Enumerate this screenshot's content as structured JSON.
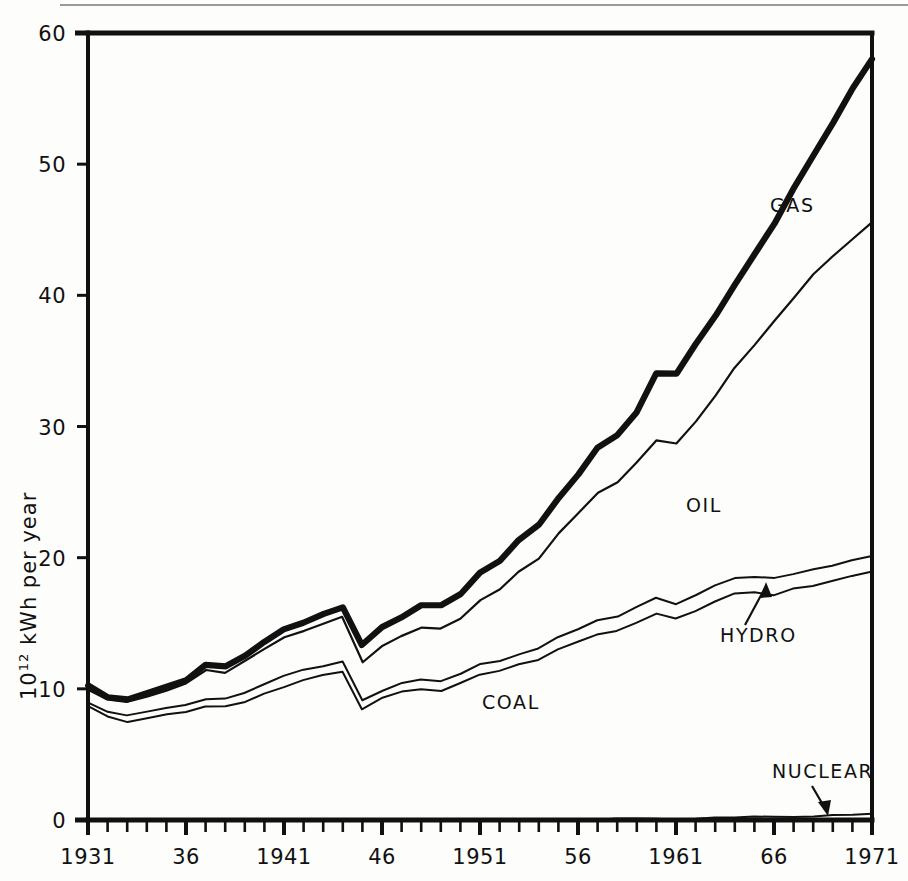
{
  "figure": {
    "title": "",
    "y_axis_label_prefix": "10",
    "y_axis_label_exponent": "12",
    "y_axis_label_suffix": " kWh per year"
  },
  "axes": {
    "y_ticks": [
      "0",
      "10",
      "20",
      "30",
      "40",
      "50",
      "60"
    ],
    "x_ticks": [
      "1931",
      "36",
      "1941",
      "46",
      "1951",
      "56",
      "1961",
      "66",
      "1971"
    ]
  },
  "labels": {
    "gas": "GAS",
    "oil": "OIL",
    "hydro": "HYDRO",
    "coal": "COAL",
    "nuclear": "NUCLEAR"
  },
  "colors": {
    "ink": "#111111",
    "paper": "#fdfdfb",
    "page_rule": "#9a9a9a"
  },
  "chart_data": {
    "type": "area",
    "title": "",
    "xlabel": "",
    "ylabel": "10^12 kWh per year",
    "xlim": [
      1931,
      1971
    ],
    "ylim": [
      0,
      60
    ],
    "grid": false,
    "legend": "inline-annotations",
    "stacking": "cumulative (bottom to top: NUCLEAR, COAL, HYDRO, OIL, GAS)",
    "x": [
      1931,
      1932,
      1933,
      1934,
      1935,
      1936,
      1937,
      1938,
      1939,
      1940,
      1941,
      1942,
      1943,
      1944,
      1945,
      1946,
      1947,
      1948,
      1949,
      1950,
      1951,
      1952,
      1953,
      1954,
      1955,
      1956,
      1957,
      1958,
      1959,
      1960,
      1961,
      1962,
      1963,
      1964,
      1965,
      1966,
      1967,
      1968,
      1969,
      1970,
      1971
    ],
    "series": [
      {
        "name": "NUCLEAR",
        "cumulative": [
          0,
          0,
          0,
          0,
          0,
          0,
          0,
          0,
          0,
          0,
          0,
          0,
          0,
          0,
          0,
          0,
          0,
          0,
          0,
          0,
          0,
          0,
          0,
          0,
          0,
          0,
          0.02,
          0.04,
          0.06,
          0.08,
          0.1,
          0.12,
          0.15,
          0.18,
          0.22,
          0.26,
          0.3,
          0.34,
          0.38,
          0.44,
          0.5
        ],
        "values": [
          0,
          0,
          0,
          0,
          0,
          0,
          0,
          0,
          0,
          0,
          0,
          0,
          0,
          0,
          0,
          0,
          0,
          0,
          0,
          0,
          0,
          0,
          0,
          0,
          0,
          0,
          0.02,
          0.04,
          0.06,
          0.08,
          0.1,
          0.12,
          0.15,
          0.18,
          0.22,
          0.26,
          0.3,
          0.34,
          0.38,
          0.44,
          0.5
        ]
      },
      {
        "name": "COAL",
        "cumulative": [
          8.6,
          7.9,
          7.5,
          7.8,
          8.1,
          8.3,
          8.6,
          8.6,
          9.0,
          9.6,
          10.2,
          10.6,
          11.0,
          11.3,
          8.5,
          9.3,
          9.8,
          10.0,
          9.9,
          10.4,
          11.1,
          11.3,
          11.8,
          12.2,
          13.0,
          13.6,
          14.2,
          14.4,
          15.1,
          15.7,
          15.4,
          16.0,
          16.6,
          17.2,
          17.4,
          17.1,
          17.6,
          17.9,
          18.2,
          18.6,
          19.0
        ],
        "values": [
          8.6,
          7.9,
          7.5,
          7.8,
          8.1,
          8.3,
          8.6,
          8.6,
          9.0,
          9.6,
          10.2,
          10.6,
          11.0,
          11.3,
          8.5,
          9.3,
          9.8,
          10.0,
          9.9,
          10.4,
          11.1,
          11.3,
          11.8,
          12.2,
          13.0,
          13.6,
          14.2,
          14.4,
          15.1,
          15.6,
          15.3,
          15.9,
          16.5,
          17.0,
          17.2,
          16.8,
          17.3,
          17.6,
          17.8,
          18.2,
          18.5
        ]
      },
      {
        "name": "HYDRO",
        "cumulative": [
          9.0,
          8.3,
          7.9,
          8.2,
          8.6,
          8.8,
          9.2,
          9.2,
          9.7,
          10.3,
          11.0,
          11.4,
          11.8,
          12.1,
          9.1,
          9.9,
          10.4,
          10.7,
          10.6,
          11.1,
          11.9,
          12.1,
          12.7,
          13.1,
          13.9,
          14.6,
          15.3,
          15.5,
          16.2,
          16.9,
          16.5,
          17.2,
          17.9,
          18.4,
          18.6,
          18.4,
          18.8,
          19.1,
          19.4,
          19.8,
          20.1
        ],
        "values": [
          0.4,
          0.4,
          0.4,
          0.4,
          0.5,
          0.5,
          0.6,
          0.6,
          0.7,
          0.7,
          0.8,
          0.8,
          0.8,
          0.8,
          0.6,
          0.6,
          0.6,
          0.7,
          0.7,
          0.7,
          0.8,
          0.8,
          0.9,
          0.9,
          0.9,
          1.0,
          1.1,
          1.1,
          1.1,
          1.2,
          1.1,
          1.2,
          1.3,
          1.2,
          1.2,
          1.3,
          1.2,
          1.2,
          1.2,
          1.2,
          1.1
        ]
      },
      {
        "name": "OIL",
        "cumulative": [
          9.9,
          9.2,
          9.0,
          9.4,
          9.9,
          10.4,
          11.4,
          11.2,
          12.1,
          13.0,
          13.9,
          14.4,
          15.0,
          15.5,
          12.0,
          13.2,
          14.0,
          14.7,
          14.6,
          15.4,
          16.8,
          17.6,
          18.9,
          20.0,
          21.8,
          23.3,
          25.0,
          25.7,
          27.2,
          29.0,
          28.7,
          30.4,
          32.4,
          34.4,
          36.2,
          38.1,
          39.9,
          41.6,
          43.0,
          44.3,
          45.5
        ],
        "values": [
          0.9,
          0.9,
          1.1,
          1.2,
          1.3,
          1.6,
          2.2,
          2.0,
          2.4,
          2.7,
          2.9,
          3.0,
          3.2,
          3.4,
          2.9,
          3.3,
          3.6,
          4.0,
          4.0,
          4.3,
          4.9,
          5.5,
          6.2,
          6.9,
          7.9,
          8.7,
          9.7,
          10.2,
          11.0,
          12.1,
          12.2,
          13.2,
          14.5,
          16.0,
          17.6,
          19.7,
          21.1,
          22.5,
          23.6,
          24.5,
          25.4
        ]
      },
      {
        "name": "GAS",
        "cumulative": [
          10.3,
          9.3,
          9.2,
          9.6,
          10.2,
          10.7,
          11.9,
          11.7,
          12.6,
          13.6,
          14.5,
          15.1,
          15.7,
          16.2,
          13.4,
          14.7,
          15.5,
          16.3,
          16.3,
          17.2,
          18.8,
          19.8,
          21.3,
          22.6,
          24.6,
          26.4,
          28.4,
          29.3,
          31.0,
          34.0,
          34.0,
          36.2,
          38.5,
          40.8,
          43.2,
          45.5,
          48.0,
          50.6,
          53.2,
          55.8,
          58.0
        ],
        "values": [
          0.4,
          0.1,
          0.2,
          0.2,
          0.3,
          0.3,
          0.5,
          0.5,
          0.5,
          0.6,
          0.6,
          0.7,
          0.7,
          0.7,
          1.4,
          1.5,
          1.5,
          1.6,
          1.7,
          1.8,
          2.0,
          2.2,
          2.4,
          2.6,
          2.8,
          3.1,
          3.4,
          3.6,
          3.8,
          5.0,
          5.3,
          5.8,
          6.1,
          6.4,
          7.0,
          7.4,
          8.1,
          9.0,
          10.2,
          11.5,
          12.5
        ]
      }
    ],
    "annotations": [
      {
        "text": "GAS",
        "x": 1966,
        "y": 48,
        "kind": "inline"
      },
      {
        "text": "OIL",
        "x": 1962,
        "y": 26,
        "kind": "inline"
      },
      {
        "text": "HYDRO",
        "x": 1964,
        "y": 12,
        "kind": "leader-arrow"
      },
      {
        "text": "COAL",
        "x": 1952,
        "y": 8,
        "kind": "inline"
      },
      {
        "text": "NUCLEAR",
        "x": 1967,
        "y": 4,
        "kind": "leader-arrow"
      }
    ]
  }
}
